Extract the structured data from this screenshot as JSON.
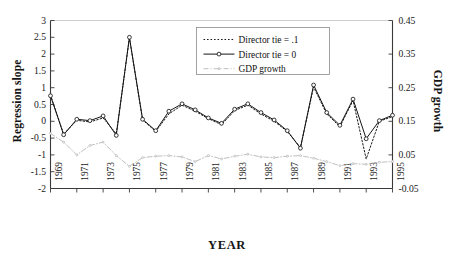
{
  "chart_data": {
    "type": "line",
    "title": "",
    "xlabel": "YEAR",
    "ylabel": "Regression slope",
    "ylabel_right": "GDP growth",
    "x": [
      1969,
      1970,
      1971,
      1972,
      1973,
      1974,
      1975,
      1976,
      1977,
      1978,
      1979,
      1980,
      1981,
      1982,
      1983,
      1984,
      1985,
      1986,
      1987,
      1988,
      1989,
      1990,
      1991,
      1992,
      1993,
      1994,
      1995
    ],
    "xtick_labels": [
      "1969",
      "1971",
      "1973",
      "1975",
      "1977",
      "1979",
      "1981",
      "1983",
      "1985",
      "1987",
      "1989",
      "1991",
      "1993",
      "1995"
    ],
    "xtick_step": 2,
    "ylim": [
      -2,
      3
    ],
    "ytick_labels": [
      "3",
      "2.5",
      "2",
      "1.5",
      "1",
      "0.5",
      "0",
      "-0.5",
      "-1",
      "-1.5",
      "-2"
    ],
    "ylim_right": [
      -0.05,
      0.45
    ],
    "ytick_labels_right": [
      "0.45",
      "0.35",
      "0.25",
      "0.15",
      "0.05",
      "-0.05"
    ],
    "grid": false,
    "legend_position": "top-right-inside",
    "series": [
      {
        "name": "Director tie = .1",
        "axis": "left",
        "style": "dotted",
        "marker": "none",
        "color": "#1a1a1a",
        "values": [
          0.78,
          -0.38,
          0.03,
          -0.02,
          0.1,
          -0.37,
          2.48,
          0.04,
          -0.3,
          0.22,
          0.48,
          0.3,
          0.08,
          -0.1,
          0.32,
          0.48,
          0.22,
          0.0,
          -0.3,
          -0.78,
          1.02,
          0.22,
          -0.16,
          0.62,
          -1.12,
          0.0,
          0.14
        ]
      },
      {
        "name": "Director tie = 0",
        "axis": "left",
        "style": "solid",
        "marker": "circle",
        "color": "#151515",
        "values": [
          0.76,
          -0.4,
          0.06,
          0.02,
          0.16,
          -0.42,
          2.5,
          0.06,
          -0.28,
          0.3,
          0.52,
          0.34,
          0.1,
          -0.06,
          0.36,
          0.52,
          0.26,
          0.04,
          -0.28,
          -0.8,
          1.08,
          0.26,
          -0.12,
          0.66,
          -0.52,
          0.02,
          0.18
        ]
      },
      {
        "name": "GDP growth",
        "axis": "right",
        "style": "dash-dot",
        "marker": "dot",
        "color": "#b3b3b3",
        "values_left_scale": [
          -0.36,
          -0.62,
          -1.0,
          -0.72,
          -0.62,
          -1.02,
          -1.34,
          -1.08,
          -1.04,
          -1.02,
          -1.06,
          -1.2,
          -1.02,
          -1.12,
          -1.04,
          -0.98,
          -1.06,
          -1.08,
          -1.04,
          -1.02,
          -1.1,
          -1.2,
          -1.32,
          -1.26,
          -1.28,
          -1.22,
          -1.2
        ],
        "values": [
          0.114,
          0.088,
          0.05,
          0.078,
          0.088,
          0.048,
          0.016,
          0.042,
          0.046,
          0.048,
          0.044,
          0.03,
          0.048,
          0.038,
          0.046,
          0.052,
          0.044,
          0.042,
          0.046,
          0.048,
          0.04,
          0.03,
          0.018,
          0.024,
          0.022,
          0.028,
          0.03
        ]
      }
    ]
  },
  "legend": {
    "items": [
      {
        "label": "Director tie = .1"
      },
      {
        "label": "Director tie = 0"
      },
      {
        "label": "GDP growth"
      }
    ]
  }
}
